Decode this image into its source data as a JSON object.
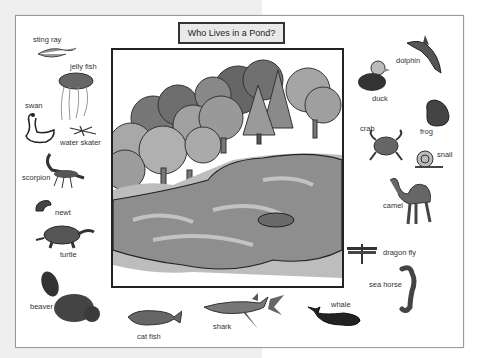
{
  "title": "Who Lives in a Pond?",
  "scene": {
    "name": "pond-scene",
    "description": "Illustration of a pond surrounded by trees"
  },
  "colors": {
    "background_left": "#efefef",
    "card_bg": "#ffffff",
    "title_bg": "#e9e9e9",
    "border": "#222222",
    "label_text": "#333333"
  },
  "animals": [
    {
      "id": "sting-ray",
      "label": "sting ray"
    },
    {
      "id": "jelly-fish",
      "label": "jelly fish"
    },
    {
      "id": "swan",
      "label": "swan"
    },
    {
      "id": "water-skater",
      "label": "water skater"
    },
    {
      "id": "scorpion",
      "label": "scorpion"
    },
    {
      "id": "newt",
      "label": "newt"
    },
    {
      "id": "turtle",
      "label": "turtle"
    },
    {
      "id": "beaver",
      "label": "beaver"
    },
    {
      "id": "cat-fish",
      "label": "cat fish"
    },
    {
      "id": "shark",
      "label": "shark"
    },
    {
      "id": "whale",
      "label": "whale"
    },
    {
      "id": "sea-horse",
      "label": "sea horse"
    },
    {
      "id": "dragon-fly",
      "label": "dragon fly"
    },
    {
      "id": "camel",
      "label": "camel"
    },
    {
      "id": "snail",
      "label": "snail"
    },
    {
      "id": "crab",
      "label": "crab"
    },
    {
      "id": "frog",
      "label": "frog"
    },
    {
      "id": "duck",
      "label": "duck"
    },
    {
      "id": "dolphin",
      "label": "dolphin"
    }
  ]
}
